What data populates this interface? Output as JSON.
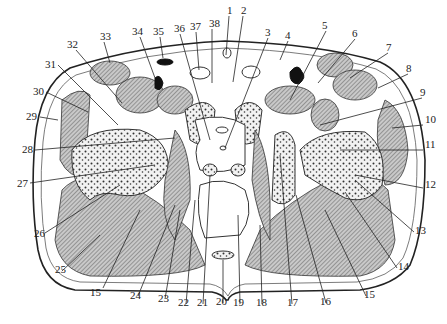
{
  "figure": {
    "type": "anatomical-cross-section",
    "colors": {
      "ink": "#222222",
      "muscle_hatch": "#8a8a8a",
      "background": "#ffffff",
      "vessel_fill": "#111111"
    }
  },
  "labels": [
    {
      "id": "1",
      "text": "1",
      "x": 231,
      "y": 14
    },
    {
      "id": "2",
      "text": "2",
      "x": 244,
      "y": 14
    },
    {
      "id": "3",
      "text": "3",
      "x": 268,
      "y": 36
    },
    {
      "id": "4",
      "text": "4",
      "x": 288,
      "y": 39
    },
    {
      "id": "5",
      "text": "5",
      "x": 326,
      "y": 29
    },
    {
      "id": "6",
      "text": "6",
      "x": 355,
      "y": 37
    },
    {
      "id": "7",
      "text": "7",
      "x": 388,
      "y": 51
    },
    {
      "id": "8",
      "text": "8",
      "x": 408,
      "y": 72
    },
    {
      "id": "9",
      "text": "9",
      "x": 422,
      "y": 96
    },
    {
      "id": "10",
      "text": "10",
      "x": 424,
      "y": 123
    },
    {
      "id": "11",
      "text": "11",
      "x": 424,
      "y": 148
    },
    {
      "id": "12",
      "text": "12",
      "x": 424,
      "y": 188
    },
    {
      "id": "13",
      "text": "13",
      "x": 415,
      "y": 234
    },
    {
      "id": "14",
      "text": "14",
      "x": 398,
      "y": 270
    },
    {
      "id": "15",
      "text": "15",
      "x": 366,
      "y": 298
    },
    {
      "id": "16",
      "text": "16",
      "x": 326,
      "y": 305
    },
    {
      "id": "17",
      "text": "17",
      "x": 290,
      "y": 306
    },
    {
      "id": "18",
      "text": "18",
      "x": 260,
      "y": 306
    },
    {
      "id": "19",
      "text": "19",
      "x": 236,
      "y": 306
    },
    {
      "id": "20",
      "text": "20",
      "x": 219,
      "y": 305
    },
    {
      "id": "21",
      "text": "21",
      "x": 199,
      "y": 306
    },
    {
      "id": "22",
      "text": "22",
      "x": 180,
      "y": 306
    },
    {
      "id": "23",
      "text": "23",
      "x": 161,
      "y": 302
    },
    {
      "id": "24",
      "text": "24",
      "x": 132,
      "y": 299
    },
    {
      "id": "25",
      "text": "25",
      "x": 56,
      "y": 273
    },
    {
      "id": "26",
      "text": "26",
      "x": 36,
      "y": 237
    },
    {
      "id": "27",
      "text": "27",
      "x": 19,
      "y": 187
    },
    {
      "id": "28",
      "text": "28",
      "x": 23,
      "y": 153
    },
    {
      "id": "29",
      "text": "29",
      "x": 27,
      "y": 120
    },
    {
      "id": "30",
      "text": "30",
      "x": 34,
      "y": 95
    },
    {
      "id": "31",
      "text": "31",
      "x": 46,
      "y": 68
    },
    {
      "id": "32",
      "text": "32",
      "x": 68,
      "y": 48
    },
    {
      "id": "33",
      "text": "33",
      "x": 101,
      "y": 40
    },
    {
      "id": "34",
      "text": "34",
      "x": 134,
      "y": 35
    },
    {
      "id": "35",
      "text": "35",
      "x": 155,
      "y": 35
    },
    {
      "id": "36",
      "text": "36",
      "x": 177,
      "y": 32
    },
    {
      "id": "37",
      "text": "37",
      "x": 192,
      "y": 30
    },
    {
      "id": "38",
      "text": "38",
      "x": 212,
      "y": 27
    }
  ]
}
